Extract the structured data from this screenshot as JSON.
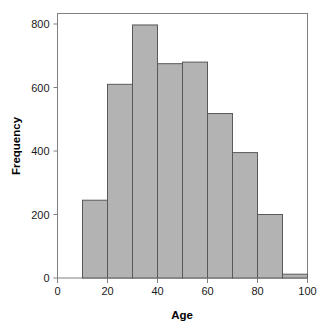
{
  "chart_data": {
    "type": "bar",
    "title": "",
    "xlabel": "Age",
    "ylabel": "Frequency",
    "xlim": [
      0,
      100
    ],
    "ylim": [
      0,
      830
    ],
    "grid": false,
    "legend": null,
    "bin_width": 10,
    "bin_edges": [
      10,
      20,
      30,
      40,
      50,
      60,
      70,
      80,
      90,
      100
    ],
    "categories": [
      "10-20",
      "20-30",
      "30-40",
      "40-50",
      "50-60",
      "60-70",
      "70-80",
      "80-90",
      "90-100"
    ],
    "values": [
      245,
      610,
      797,
      675,
      680,
      518,
      395,
      200,
      12
    ],
    "xticks": [
      0,
      20,
      40,
      60,
      80,
      100
    ],
    "xtick_labels": [
      "0",
      "20",
      "40",
      "60",
      "80",
      "100"
    ],
    "yticks": [
      0,
      200,
      400,
      600,
      800
    ],
    "ytick_labels": [
      "0",
      "200",
      "400",
      "600",
      "800"
    ],
    "bar_fill": "#b3b3b3",
    "bar_stroke": "#595959",
    "frame_stroke": "#808080",
    "axis_color": "#808080",
    "text_color": "#1a1a1a",
    "background": "#ffffff"
  },
  "axes": {
    "x_title": "Age",
    "y_title": "Frequency"
  }
}
